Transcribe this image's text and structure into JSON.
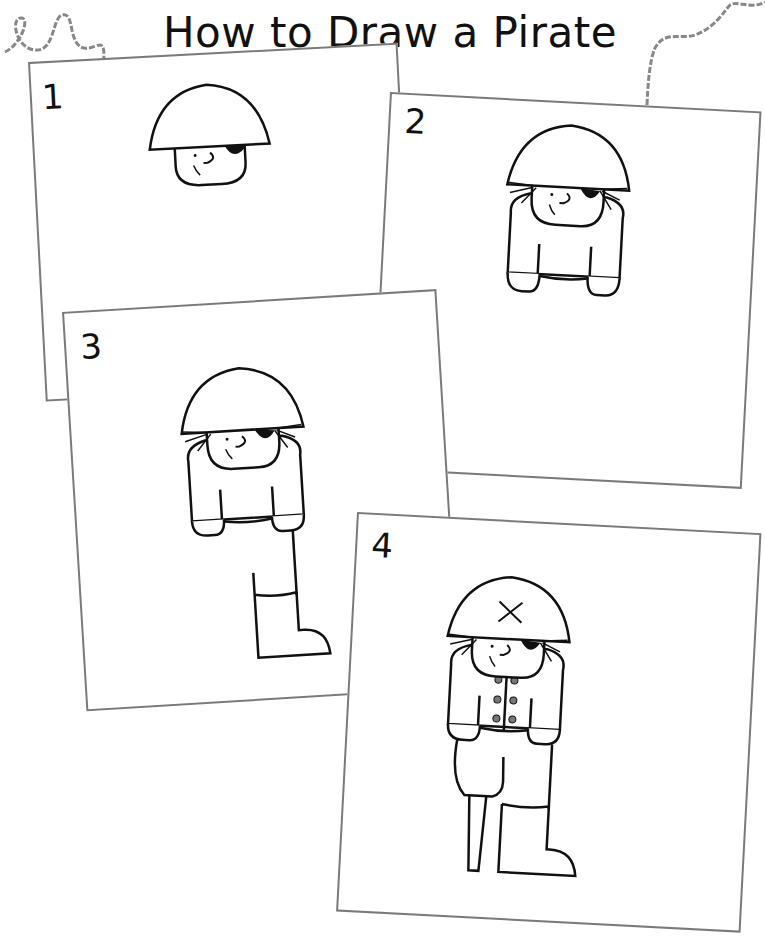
{
  "page": {
    "title": "How to Draw a Pirate",
    "colors": {
      "background": "#ffffff",
      "card_border": "#7a7a7a",
      "ink": "#111111",
      "button_fill": "#777777",
      "string": "#888888"
    }
  },
  "steps": [
    {
      "number": "1",
      "description": "Draw a half-circle hat with a round head below, an eye, nose and eye patch"
    },
    {
      "number": "2",
      "description": "Add hair and the body with two hands"
    },
    {
      "number": "3",
      "description": "Draw one leg with a boot"
    },
    {
      "number": "4",
      "description": "Add a peg leg, trousers, jacket buttons and an X on the hat"
    }
  ]
}
